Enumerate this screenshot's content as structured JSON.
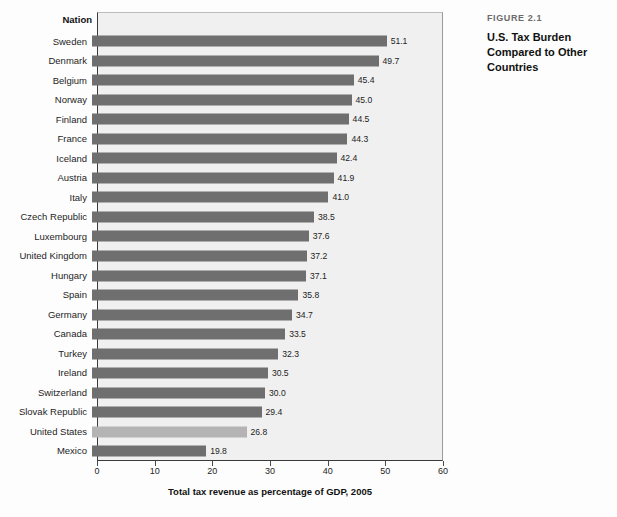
{
  "caption": {
    "figure_number": "FIGURE 2.1",
    "title": "U.S. Tax Burden Compared to Other Countries"
  },
  "chart_header": {
    "nation_column": "Nation"
  },
  "chart_data": {
    "type": "bar",
    "orientation": "horizontal",
    "title": "U.S. Tax Burden Compared to Other Countries",
    "xlabel": "Total tax revenue as percentage of GDP, 2005",
    "ylabel": "Nation",
    "xlim": [
      0,
      60
    ],
    "xticks": [
      0,
      10,
      20,
      30,
      40,
      50,
      60
    ],
    "xtick_labels": [
      "0",
      "10",
      "20",
      "30",
      "40",
      "50",
      "60"
    ],
    "grid": false,
    "legend": "none",
    "bar_color": "#6f6f6f",
    "highlight_color": "#b4b4b4",
    "highlight_category": "United States",
    "plot_background": "#f0f0f0",
    "categories": [
      "Sweden",
      "Denmark",
      "Belgium",
      "Norway",
      "Finland",
      "France",
      "Iceland",
      "Austria",
      "Italy",
      "Czech Republic",
      "Luxembourg",
      "United Kingdom",
      "Hungary",
      "Spain",
      "Germany",
      "Canada",
      "Turkey",
      "Ireland",
      "Switzerland",
      "Slovak Republic",
      "United States",
      "Mexico"
    ],
    "values": [
      51.1,
      49.7,
      45.4,
      45.0,
      44.5,
      44.3,
      42.4,
      41.9,
      41.0,
      38.5,
      37.6,
      37.2,
      37.1,
      35.8,
      34.7,
      33.5,
      32.3,
      30.5,
      30.0,
      29.4,
      26.8,
      19.8
    ],
    "value_labels": [
      "51.1",
      "49.7",
      "45.4",
      "45.0",
      "44.5",
      "44.3",
      "42.4",
      "41.9",
      "41.0",
      "38.5",
      "37.6",
      "37.2",
      "37.1",
      "35.8",
      "34.7",
      "33.5",
      "32.3",
      "30.5",
      "30.0",
      "29.4",
      "26.8",
      "19.8"
    ]
  }
}
